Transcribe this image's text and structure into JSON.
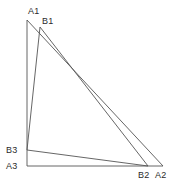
{
  "diagram": {
    "type": "geometry-two-triangles",
    "background_color": "#ffffff",
    "stroke_color": "#555555",
    "label_color": "#2b2b2b",
    "stroke_width": 0.9,
    "canvas": {
      "width": 184,
      "height": 193
    },
    "points": {
      "A1": {
        "label": "A1",
        "x": 27,
        "y": 20,
        "label_x": 28,
        "label_y": 6
      },
      "A2": {
        "label": "A2",
        "x": 163,
        "y": 166,
        "label_x": 155,
        "label_y": 170
      },
      "A3": {
        "label": "A3",
        "x": 27,
        "y": 166,
        "label_x": 6,
        "label_y": 161
      },
      "B1": {
        "label": "B1",
        "x": 40,
        "y": 27,
        "label_x": 42,
        "label_y": 16
      },
      "B2": {
        "label": "B2",
        "x": 148,
        "y": 166,
        "label_x": 138,
        "label_y": 170
      },
      "B3": {
        "label": "B3",
        "x": 27,
        "y": 150,
        "label_x": 6,
        "label_y": 145
      }
    },
    "triangles": [
      {
        "name": "triangle-A",
        "vertices": [
          "A1",
          "A2",
          "A3"
        ]
      },
      {
        "name": "triangle-B",
        "vertices": [
          "B1",
          "B2",
          "B3"
        ]
      }
    ],
    "edges": [
      {
        "name": "edge-A1-A2",
        "from": "A1",
        "to": "A2"
      },
      {
        "name": "edge-A2-A3",
        "from": "A2",
        "to": "A3"
      },
      {
        "name": "edge-A3-A1",
        "from": "A3",
        "to": "A1"
      },
      {
        "name": "edge-B1-B2",
        "from": "B1",
        "to": "B2"
      },
      {
        "name": "edge-B2-B3",
        "from": "B2",
        "to": "B3"
      },
      {
        "name": "edge-B3-B1",
        "from": "B3",
        "to": "B1"
      }
    ]
  }
}
